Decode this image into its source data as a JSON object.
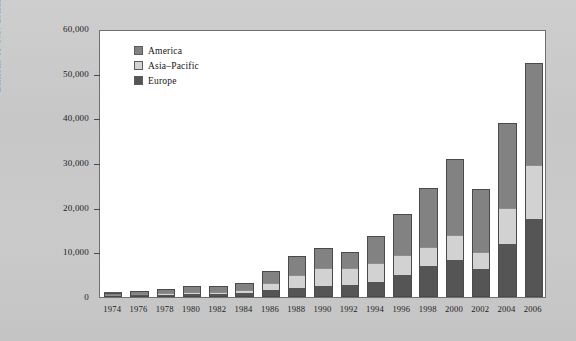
{
  "chart_data": {
    "type": "bar",
    "stacked": true,
    "title": "",
    "xlabel": "",
    "ylabel": "Billions of U.S. dollars",
    "ylim": [
      0,
      60000
    ],
    "yticks": [
      0,
      10000,
      20000,
      30000,
      40000,
      50000,
      60000
    ],
    "ytick_labels": [
      "0",
      "10,000",
      "20,000",
      "30,000",
      "40,000",
      "50,000",
      "60,000"
    ],
    "grid": false,
    "legend_position": "top-left inside",
    "categories": [
      "1974",
      "1976",
      "1978",
      "1980",
      "1982",
      "1984",
      "1986",
      "1988",
      "1990",
      "1992",
      "1994",
      "1996",
      "1998",
      "2000",
      "2002",
      "2004",
      "2006"
    ],
    "series": [
      {
        "name": "Europe",
        "color": "#555555",
        "values": [
          300,
          400,
          500,
          700,
          700,
          900,
          1500,
          2000,
          2500,
          2600,
          3400,
          5000,
          6900,
          8200,
          6200,
          11800,
          17500
        ]
      },
      {
        "name": "Asia-Pacific",
        "color": "#d2d2d2",
        "values": [
          200,
          300,
          400,
          500,
          500,
          700,
          1700,
          3000,
          4000,
          3800,
          4300,
          4500,
          4200,
          5600,
          3900,
          8200,
          12000
        ]
      },
      {
        "name": "America",
        "color": "#828282",
        "values": [
          500,
          700,
          900,
          1200,
          1200,
          1500,
          2700,
          4100,
          4400,
          3700,
          6000,
          9000,
          13300,
          17100,
          14000,
          19000,
          23000
        ]
      }
    ],
    "totals": [
      1000,
      1400,
      1800,
      2400,
      2400,
      3100,
      5900,
      9100,
      10900,
      10100,
      13700,
      18500,
      24400,
      30900,
      24100,
      39000,
      52500
    ]
  },
  "legend": {
    "items": [
      {
        "label": "America",
        "color": "#828282"
      },
      {
        "label": "Asia–Pacific",
        "color": "#d2d2d2"
      },
      {
        "label": "Europe",
        "color": "#555555"
      }
    ]
  }
}
